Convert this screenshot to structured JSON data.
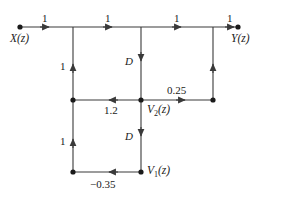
{
  "figure": {
    "type": "signal-flow-graph",
    "background": "#ffffff",
    "line_color": "#3a3a3a",
    "text_color": "#1a1a1a",
    "width": 286,
    "height": 199
  },
  "nodes": [
    {
      "id": "x",
      "label": "X(z)",
      "var": "X",
      "sub": "",
      "arg": "(z)",
      "x": 20,
      "y": 27,
      "dot": true
    },
    {
      "id": "t1",
      "label": "",
      "x": 73,
      "y": 27,
      "dot": false
    },
    {
      "id": "t2",
      "label": "",
      "x": 141,
      "y": 27,
      "dot": false
    },
    {
      "id": "t3",
      "label": "",
      "x": 213,
      "y": 27,
      "dot": false
    },
    {
      "id": "y",
      "label": "Y(z)",
      "var": "Y",
      "sub": "",
      "arg": "(z)",
      "x": 238,
      "y": 27,
      "dot": true
    },
    {
      "id": "m1",
      "label": "",
      "x": 73,
      "y": 100,
      "dot": true
    },
    {
      "id": "v2",
      "label": "V2(z)",
      "var": "V",
      "sub": "2",
      "arg": "(z)",
      "x": 141,
      "y": 100,
      "dot": true
    },
    {
      "id": "m3",
      "label": "",
      "x": 213,
      "y": 100,
      "dot": true
    },
    {
      "id": "b1",
      "label": "",
      "x": 73,
      "y": 172,
      "dot": true
    },
    {
      "id": "v1",
      "label": "V1(z)",
      "var": "V",
      "sub": "1",
      "arg": "(z)",
      "x": 141,
      "y": 172,
      "dot": true
    }
  ],
  "branches": [
    {
      "id": "x-to-t1",
      "gain": "1",
      "from": "x",
      "to": "t1",
      "direction": "right",
      "label_pos": "above"
    },
    {
      "id": "t1-to-t2",
      "gain": "1",
      "from": "t1",
      "to": "t2",
      "direction": "right",
      "label_pos": "above"
    },
    {
      "id": "t2-to-t3",
      "gain": "1",
      "from": "t2",
      "to": "t3",
      "direction": "right",
      "label_pos": "above"
    },
    {
      "id": "t3-to-y",
      "gain": "1",
      "from": "t3",
      "to": "y",
      "direction": "right",
      "label_pos": "above"
    },
    {
      "id": "m1-to-t1",
      "gain": "1",
      "from": "m1",
      "to": "t1",
      "direction": "up",
      "label_pos": "left"
    },
    {
      "id": "t2-to-v2",
      "gain": "D",
      "from": "t2",
      "to": "v2",
      "direction": "down",
      "label_pos": "left"
    },
    {
      "id": "v2-to-m1",
      "gain": "1.2",
      "from": "v2",
      "to": "m1",
      "direction": "left",
      "label_pos": "below"
    },
    {
      "id": "v2-to-m3",
      "gain": "0.25",
      "from": "v2",
      "to": "m3",
      "direction": "right",
      "label_pos": "above"
    },
    {
      "id": "m3-to-t3",
      "gain": "",
      "from": "m3",
      "to": "t3",
      "direction": "up",
      "label_pos": "none"
    },
    {
      "id": "v2-to-v1",
      "gain": "D",
      "from": "v2",
      "to": "v1",
      "direction": "down",
      "label_pos": "left"
    },
    {
      "id": "v1-to-b1",
      "gain": "−0.35",
      "from": "v1",
      "to": "b1",
      "direction": "left",
      "label_pos": "below"
    },
    {
      "id": "b1-to-m1",
      "gain": "1",
      "from": "b1",
      "to": "m1",
      "direction": "up",
      "label_pos": "left"
    }
  ],
  "labels": {
    "x_node": "X(z)",
    "y_node": "Y(z)",
    "v1_node": "V",
    "v1_sub": "1",
    "v1_arg": "(z)",
    "v2_node": "V",
    "v2_sub": "2",
    "v2_arg": "(z)",
    "gain_top_1": "1",
    "gain_top_2": "1",
    "gain_top_3": "1",
    "gain_top_4": "1",
    "gain_left_upper": "1",
    "gain_left_lower": "1",
    "gain_delay_upper": "D",
    "gain_delay_lower": "D",
    "gain_feedback_mid": "1.2",
    "gain_forward_025": "0.25",
    "gain_feedback_bottom": "−0.35"
  }
}
